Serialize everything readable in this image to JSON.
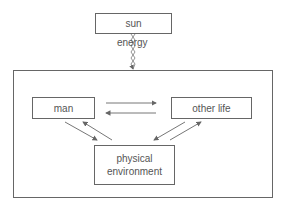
{
  "diagram": {
    "nodes": {
      "sun": "sun",
      "man": "man",
      "other_life": "other life",
      "physical_environment": "physical environment"
    },
    "edge_labels": {
      "energy": "energy"
    },
    "edges": [
      {
        "from": "sun",
        "to": "system",
        "label": "energy"
      },
      {
        "from": "man",
        "to": "other life"
      },
      {
        "from": "other life",
        "to": "man"
      },
      {
        "from": "man",
        "to": "physical environment"
      },
      {
        "from": "physical environment",
        "to": "man"
      },
      {
        "from": "other life",
        "to": "physical environment"
      },
      {
        "from": "physical environment",
        "to": "other life"
      }
    ]
  }
}
